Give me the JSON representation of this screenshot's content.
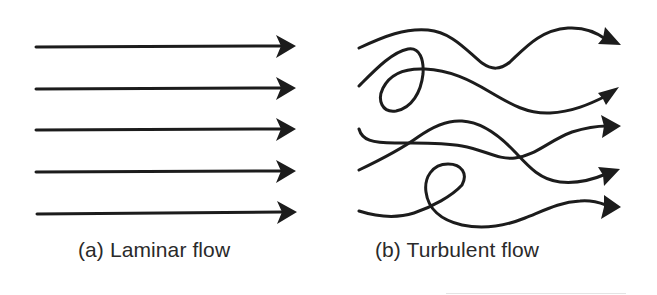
{
  "figure": {
    "panels": [
      {
        "id": "a",
        "caption": "(a) Laminar flow",
        "streamline_count": 5,
        "description": "parallel straight streamlines"
      },
      {
        "id": "b",
        "caption": "(b) Turbulent flow",
        "streamline_count": 5,
        "description": "irregular crossing and looping streamlines"
      }
    ],
    "colors": {
      "ink": "#1c1c1c",
      "caption": "#2a2a2a",
      "background": "#ffffff"
    },
    "icons": {
      "arrow": "arrowhead-right-icon"
    }
  }
}
